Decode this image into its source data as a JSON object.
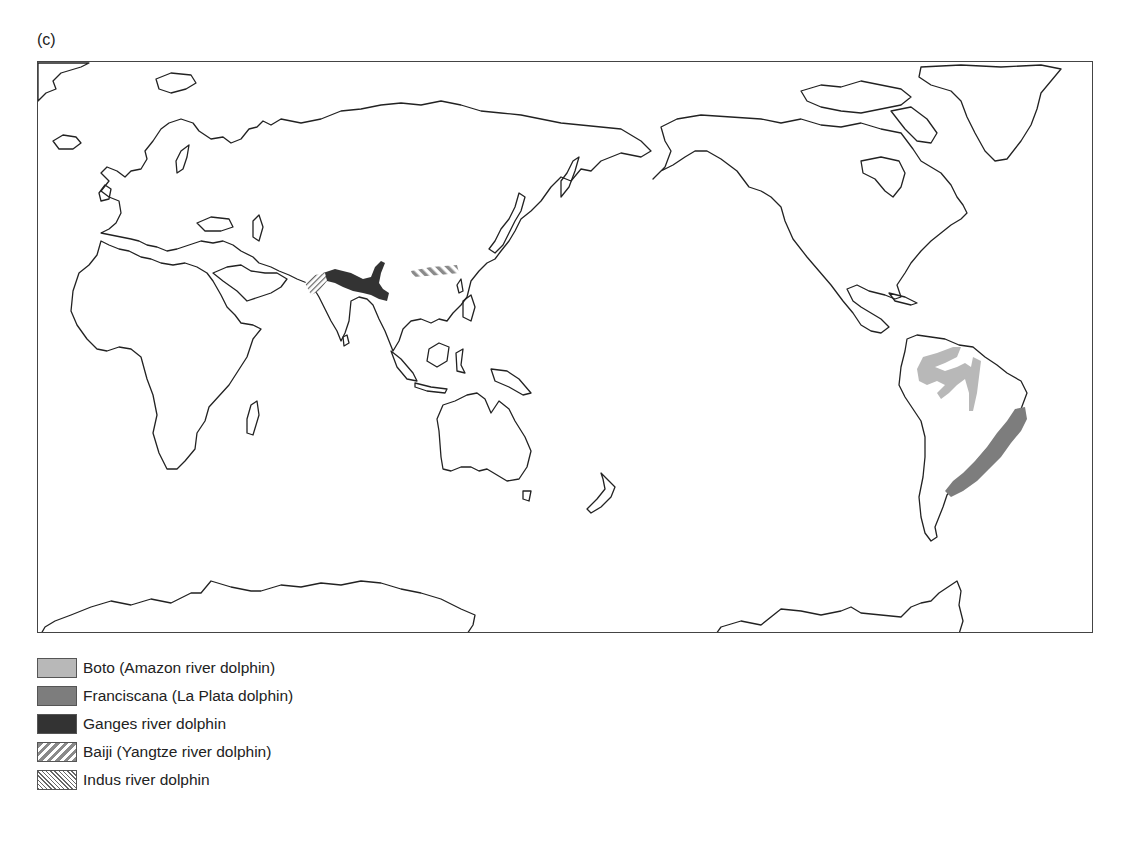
{
  "figure": {
    "panel_label": "(c)"
  },
  "map": {
    "projection": "Pacific-centred world map",
    "ranges": [
      {
        "id": "boto",
        "name": "Boto (Amazon river dolphin)",
        "region": "Amazon basin, South America",
        "fill": "#b8b8b8",
        "pattern": "solid"
      },
      {
        "id": "franciscana",
        "name": "Franciscana (La Plata dolphin)",
        "region": "Atlantic coast of Brazil, Uruguay and Argentina",
        "fill": "#7d7d7d",
        "pattern": "solid"
      },
      {
        "id": "ganges",
        "name": "Ganges river dolphin",
        "region": "Ganges-Brahmaputra river system",
        "fill": "#333333",
        "pattern": "solid"
      },
      {
        "id": "baiji",
        "name": "Baiji (Yangtze river dolphin)",
        "region": "Yangtze river, China",
        "fill": "#8a8a8a",
        "pattern": "diagonal-wide"
      },
      {
        "id": "indus",
        "name": "Indus river dolphin",
        "region": "Indus river, Pakistan",
        "fill": "#666666",
        "pattern": "diagonal-fine"
      }
    ]
  },
  "legend": {
    "items": [
      {
        "label": "Boto (Amazon river dolphin)",
        "color": "#b8b8b8",
        "pattern": "solid"
      },
      {
        "label": "Franciscana (La Plata dolphin)",
        "color": "#7d7d7d",
        "pattern": "solid"
      },
      {
        "label": "Ganges river dolphin",
        "color": "#333333",
        "pattern": "solid"
      },
      {
        "label": "Baiji (Yangtze river dolphin)",
        "color": "#8a8a8a",
        "pattern": "hatch-wide"
      },
      {
        "label": "Indus river dolphin",
        "color": "#666666",
        "pattern": "hatch-fine"
      }
    ]
  }
}
